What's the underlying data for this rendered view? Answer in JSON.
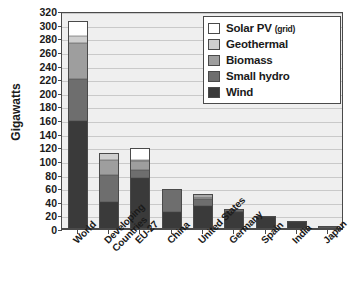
{
  "chart_data": {
    "type": "bar",
    "stacked": true,
    "title": "",
    "xlabel": "",
    "ylabel": "Gigawatts",
    "ylim": [
      0,
      320
    ],
    "ytick_step": 20,
    "yticks": [
      0,
      20,
      40,
      60,
      80,
      100,
      120,
      140,
      160,
      180,
      200,
      220,
      240,
      260,
      280,
      300,
      320
    ],
    "grid": true,
    "legend_position": "top-right",
    "categories": [
      "World",
      "Developing Countries",
      "EU-27",
      "China",
      "United States",
      "Germany",
      "Spain",
      "India",
      "Japan"
    ],
    "category_lines": [
      [
        "World"
      ],
      [
        "Developing",
        "Countries"
      ],
      [
        "EU-27"
      ],
      [
        "China"
      ],
      [
        "United States"
      ],
      [
        "Germany"
      ],
      [
        "Spain"
      ],
      [
        "India"
      ],
      [
        "Japan"
      ]
    ],
    "series": [
      {
        "name": "Wind",
        "color": "#3a3a3a",
        "values": [
          159,
          40,
          75,
          25,
          34,
          25,
          17,
          10,
          2
        ]
      },
      {
        "name": "Small hydro",
        "color": "#6e6e6e",
        "values": [
          61,
          40,
          11,
          34,
          10,
          2,
          2,
          2,
          1
        ]
      },
      {
        "name": "Biomass",
        "color": "#9e9e9e",
        "values": [
          53,
          21,
          14,
          0,
          3,
          1,
          0,
          0,
          1
        ]
      },
      {
        "name": "Geothermal",
        "color": "#cfcfcf",
        "values": [
          10,
          10,
          1,
          0,
          3,
          0,
          0,
          0,
          0
        ]
      },
      {
        "name": "Solar PV (grid)",
        "color": "#ffffff",
        "values": [
          22,
          0,
          18,
          0,
          1,
          2,
          0,
          0,
          1
        ]
      }
    ],
    "totals": [
      305,
      111,
      119,
      59,
      51,
      30,
      19,
      12,
      5
    ]
  },
  "legend": {
    "items": [
      {
        "label": "Solar PV ",
        "sublabel": "(grid)",
        "key": "solar"
      },
      {
        "label": "Geothermal",
        "sublabel": "",
        "key": "geo"
      },
      {
        "label": "Biomass",
        "sublabel": "",
        "key": "biomass"
      },
      {
        "label": "Small hydro",
        "sublabel": "",
        "key": "hydro"
      },
      {
        "label": "Wind",
        "sublabel": "",
        "key": "wind"
      }
    ]
  },
  "colors": {
    "plot_background": "#efefef",
    "grid": "#c9c9c9",
    "axis": "#4a4a4a",
    "text": "#1a1a1a"
  }
}
